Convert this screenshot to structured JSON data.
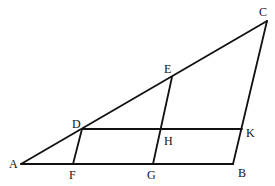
{
  "diagram": {
    "type": "geometry-figure",
    "stroke_color": "#111111",
    "background": "#ffffff",
    "points": {
      "A": {
        "x": 21,
        "y": 164,
        "label": "A",
        "lx": 9,
        "ly": 168
      },
      "B": {
        "x": 233,
        "y": 164,
        "label": "B",
        "lx": 238,
        "ly": 177
      },
      "C": {
        "x": 267,
        "y": 21,
        "label": "C",
        "lx": 259,
        "ly": 16
      },
      "D": {
        "x": 82,
        "y": 129,
        "label": "D",
        "lx": 72,
        "ly": 128
      },
      "E": {
        "x": 172,
        "y": 77,
        "label": "E",
        "lx": 164,
        "ly": 73
      },
      "F": {
        "x": 73,
        "y": 164,
        "label": "F",
        "lx": 69,
        "ly": 179
      },
      "G": {
        "x": 153,
        "y": 164,
        "label": "G",
        "lx": 147,
        "ly": 179
      },
      "H": {
        "x": 161,
        "y": 129,
        "label": "H",
        "lx": 164,
        "ly": 145
      },
      "K": {
        "x": 242,
        "y": 129,
        "label": "K",
        "lx": 246,
        "ly": 137
      }
    },
    "segments": [
      [
        "A",
        "B"
      ],
      [
        "A",
        "C"
      ],
      [
        "C",
        "B"
      ],
      [
        "D",
        "K"
      ],
      [
        "D",
        "F"
      ],
      [
        "E",
        "G"
      ]
    ]
  }
}
